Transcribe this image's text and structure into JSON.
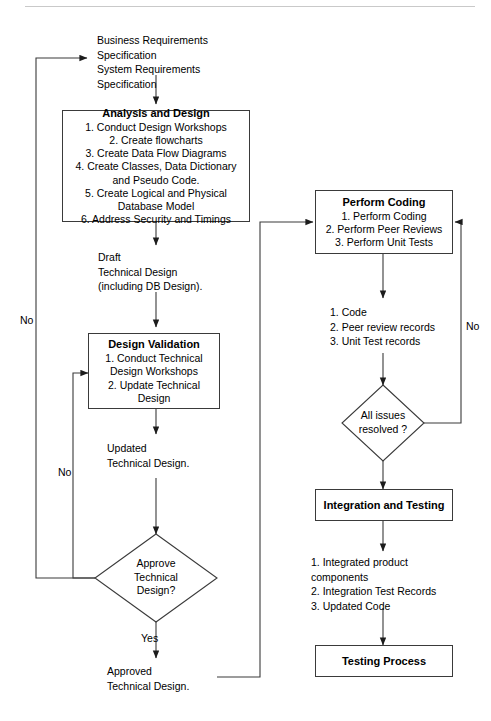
{
  "diagram": {
    "nodes": {
      "analysis_design": {
        "title": "Analysis and Design",
        "items": [
          "1. Conduct Design Workshops",
          "2. Create flowcharts",
          "3. Create Data Flow Diagrams",
          "4. Create Classes, Data Dictionary and Pseudo Code.",
          "5. Create Logical and Physical Database Model",
          "6. Address Security and Timings"
        ]
      },
      "design_validation": {
        "title": "Design Validation",
        "items": [
          "1. Conduct Technical Design Workshops",
          "2. Update Technical Design"
        ]
      },
      "perform_coding": {
        "title": "Perform Coding",
        "items": [
          "1. Perform Coding",
          "2. Perform Peer Reviews",
          "3. Perform Unit Tests"
        ]
      },
      "integration_testing": {
        "title": "Integration and Testing",
        "items": []
      },
      "testing_process": {
        "title": "Testing Process",
        "items": []
      }
    },
    "decisions": {
      "approve_design": "Approve\nTechnical\nDesign?",
      "all_issues": "All issues\nresolved ?"
    },
    "artifacts": {
      "requirements": "Business Requirements\nSpecification\nSystem Requirements\nSpecification",
      "draft_design": "Draft\nTechnical Design\n(including DB Design).",
      "updated_design": "Updated\nTechnical Design.",
      "approved_design": "Approved\nTechnical Design.",
      "code_outputs": "1. Code\n2. Peer review records\n3. Unit Test records",
      "integration_outputs": "1. Integrated product\ncomponents\n2. Integration Test Records\n3. Updated Code"
    },
    "edge_labels": {
      "no_outer": "No",
      "no_inner": "No",
      "yes": "Yes",
      "no_coding": "No"
    },
    "colors": {
      "line": "#3a3a3a",
      "text": "#000000",
      "background": "#ffffff"
    }
  }
}
